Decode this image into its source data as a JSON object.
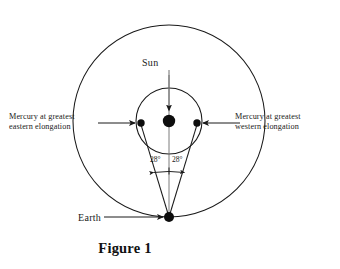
{
  "figure": {
    "caption": "Figure 1",
    "background_color": "#ffffff",
    "stroke_color": "#1a1a1a"
  },
  "labels": {
    "sun": "Sun",
    "earth": "Earth",
    "mercury_eastern_line1": "Mercury  at  greatest",
    "mercury_eastern_line2": "eastern    elongation",
    "mercury_western_line1": "Mercury  at  greatest",
    "mercury_western_line2": "western    elongation",
    "angle_left": "28°",
    "angle_right": "28°"
  },
  "geometry": {
    "center_x": 169,
    "center_y": 121,
    "earth_orbit_radius": 96,
    "mercury_orbit_radius": 33,
    "sun_dot_radius": 6,
    "earth_dot_radius": 5,
    "mercury_dot_radius": 3.6,
    "earth_x": 169,
    "earth_y": 217,
    "mercury_east_x": 141,
    "mercury_east_y": 123,
    "mercury_west_x": 197,
    "mercury_west_y": 123,
    "elongation_angle_degrees": 28
  },
  "icons": {
    "sun_pointer": "down-arrow-icon",
    "earth_pointer": "right-arrow-icon",
    "mercury_east_pointer": "right-arrow-icon",
    "mercury_west_pointer": "left-arrow-icon",
    "angle_span": "double-arrow-icon"
  }
}
